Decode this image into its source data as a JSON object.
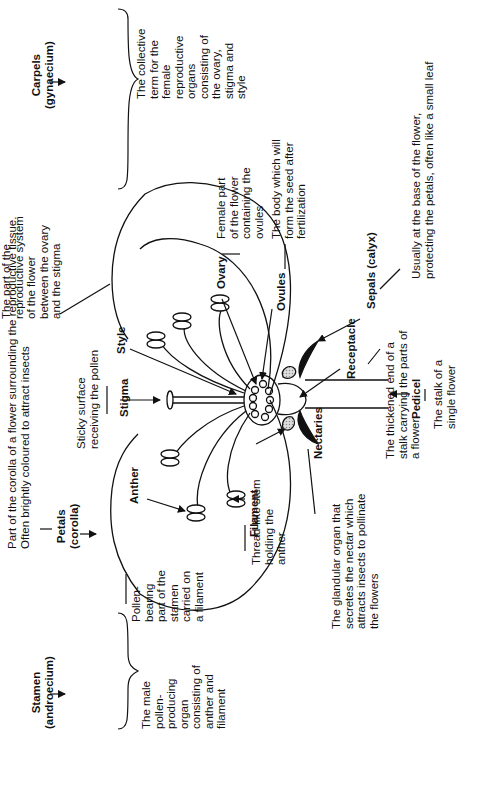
{
  "diagram": {
    "title": "Parts of a flower",
    "labels": {
      "petals": "Petals\n(corolla)",
      "petals_desc": "Part of the corolla of a flower surrounding the reproductive tissue.\nOften brightly coloured to attract insects",
      "stamen": "Stamen\n(androecium)",
      "stamen_desc": "The male\npollen-\nproducing\norgan\nconsisting of\nanther and\nfilament",
      "anther": "Anther",
      "anther_desc": "Pollen-\nbearing\npart of the\nstamen\ncarried on\na filament",
      "filament": "Filament",
      "filament_desc": "Thread-like stem\nholding the\nanther",
      "nectaries": "Nectaries",
      "nectaries_desc": "The glandular organ that\nsecretes the nectar which\nattracts insects to pollinate\nthe flowers",
      "receptacle": "Receptacle",
      "receptacle_desc": "The thickened end of a\nstalk carrying the parts of\na flower",
      "pedicel": "Pedicel",
      "pedicel_desc": "The stalk of a\nsingle flower",
      "sepals": "Sepals (calyx)",
      "sepals_desc": "Usually at the base of the flower,\nprotecting the petals, often like a small leaf",
      "stigma": "Stigma",
      "stigma_desc": "Sticky surface\nreceiving the pollen",
      "style": "Style",
      "style_desc": "The part of the\nreproductive system\nof the flower\nbetween the ovary\nand the stigma",
      "ovary": "Ovary",
      "ovary_desc": "Female part\nof the flower\ncontaining the\novules",
      "ovules": "Ovules",
      "ovules_desc": "The body which will\nform the seed after\nfertilization",
      "carpels": "Carpels\n(gynaecium)",
      "carpels_desc": "The collective\nterm for the\nfemale\nreproductive\norgans\nconsisting of\nthe ovary,\nstigma and\nstyle"
    }
  }
}
